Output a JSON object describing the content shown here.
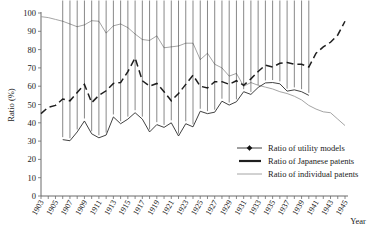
{
  "chart_data": {
    "type": "line",
    "title": "",
    "xlabel": "Year",
    "ylabel": "Ratio (%)",
    "xlim": [
      1903,
      1945
    ],
    "ylim": [
      0,
      100
    ],
    "grid": false,
    "legend_position": "inside-right",
    "y_ticks": [
      0,
      10,
      20,
      30,
      40,
      50,
      60,
      70,
      80,
      90,
      100
    ],
    "x_ticks": [
      1903,
      1905,
      1907,
      1909,
      1911,
      1913,
      1915,
      1917,
      1919,
      1921,
      1923,
      1925,
      1927,
      1929,
      1931,
      1933,
      1935,
      1937,
      1939,
      1941,
      1943,
      1945
    ],
    "x_tick_labels": [
      "1903",
      "1905",
      "1907",
      "1909",
      "1911",
      "1913",
      "1915",
      "1917",
      "1919",
      "1921",
      "1923",
      "1925",
      "1927",
      "1929",
      "1931",
      "1933",
      "1935",
      "1937",
      "1939",
      "1941",
      "1943",
      "1945"
    ],
    "y_tick_labels": [
      "0",
      "10",
      "20",
      "30",
      "40",
      "50",
      "60",
      "70",
      "80",
      "90",
      "100"
    ],
    "series": [
      {
        "name": "Ratio of utility models",
        "style": "line-markers",
        "color": "#2b2b2b",
        "marker": "diamond",
        "x": [
          1906,
          1907,
          1908,
          1909,
          1910,
          1911,
          1912,
          1913,
          1914,
          1915,
          1916,
          1917,
          1918,
          1919,
          1920,
          1921,
          1922,
          1923,
          1924,
          1925,
          1926,
          1927,
          1928,
          1929,
          1930,
          1931,
          1932,
          1933,
          1934,
          1935,
          1936,
          1937,
          1938,
          1939,
          1940
        ],
        "values": [
          30.8,
          30.2,
          35.0,
          41.0,
          34.0,
          31.8,
          33.3,
          43.2,
          39.5,
          42.0,
          45.5,
          42.0,
          35.0,
          39.0,
          37.5,
          40.0,
          32.8,
          39.5,
          37.8,
          46.3,
          45.0,
          45.8,
          51.8,
          49.7,
          51.5,
          57.0,
          55.5,
          59.3,
          61.8,
          62.0,
          61.3,
          57.3,
          58.0,
          57.0,
          55.0
        ]
      },
      {
        "name": "Ratio of Japanese patents",
        "style": "dashed",
        "color": "#1f1f1f",
        "x": [
          1903,
          1904,
          1905,
          1906,
          1907,
          1908,
          1909,
          1910,
          1911,
          1912,
          1913,
          1914,
          1915,
          1916,
          1917,
          1918,
          1919,
          1920,
          1921,
          1922,
          1923,
          1924,
          1925,
          1926,
          1927,
          1928,
          1929,
          1930,
          1931,
          1932,
          1933,
          1934,
          1935,
          1936,
          1937,
          1938,
          1939,
          1940,
          1941,
          1942,
          1943,
          1944,
          1945
        ],
        "values": [
          45.0,
          48.5,
          49.5,
          53.0,
          52.0,
          56.5,
          61.0,
          51.0,
          55.0,
          57.5,
          61.5,
          62.0,
          68.0,
          75.5,
          63.0,
          60.0,
          61.5,
          57.0,
          52.0,
          56.0,
          61.0,
          66.0,
          60.0,
          59.0,
          62.5,
          62.5,
          61.0,
          63.0,
          60.5,
          64.0,
          68.0,
          71.5,
          70.5,
          72.5,
          73.0,
          72.0,
          72.0,
          70.5,
          78.0,
          81.5,
          84.0,
          88.0,
          95.5
        ]
      },
      {
        "name": "Ratio of individual patents",
        "style": "thin-gray",
        "color": "#9a9a9a",
        "x": [
          1903,
          1904,
          1905,
          1906,
          1907,
          1908,
          1909,
          1910,
          1911,
          1912,
          1913,
          1914,
          1915,
          1916,
          1917,
          1918,
          1919,
          1920,
          1921,
          1922,
          1923,
          1924,
          1925,
          1926,
          1927,
          1928,
          1929,
          1930,
          1931,
          1932,
          1933,
          1934,
          1935,
          1936,
          1937,
          1938,
          1939,
          1940,
          1941,
          1942,
          1943,
          1944,
          1945
        ],
        "values": [
          98.0,
          97.5,
          96.5,
          95.5,
          94.0,
          92.5,
          93.5,
          95.8,
          95.5,
          89.0,
          93.0,
          94.0,
          92.0,
          88.5,
          85.5,
          85.0,
          87.5,
          81.0,
          81.5,
          82.0,
          83.5,
          83.5,
          74.5,
          78.0,
          72.0,
          70.0,
          65.5,
          67.0,
          60.0,
          62.0,
          60.5,
          59.5,
          58.5,
          57.0,
          56.0,
          54.5,
          52.5,
          49.5,
          47.5,
          46.0,
          45.5,
          42.0,
          38.5
        ]
      }
    ]
  },
  "legend": {
    "items": [
      {
        "label": "Ratio of utility models",
        "key": "utility"
      },
      {
        "label": "Ratio of Japanese patents",
        "key": "japanese"
      },
      {
        "label": "Ratio of individual patents",
        "key": "individual"
      }
    ]
  },
  "axes": {
    "y_title": "Ratio (%)",
    "x_title": "Year"
  }
}
